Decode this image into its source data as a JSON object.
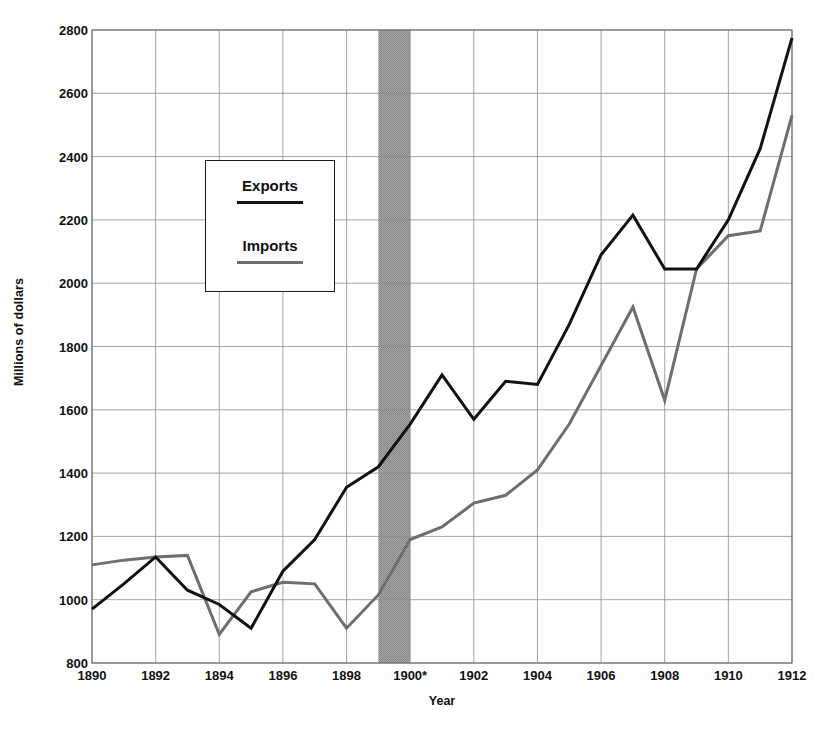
{
  "chart_data": {
    "type": "line",
    "title": "",
    "xlabel": "Year",
    "ylabel": "Millions of dollars",
    "xlim": [
      1890,
      1912
    ],
    "ylim": [
      800,
      2800
    ],
    "xticks": [
      "1890",
      "1892",
      "1894",
      "1896",
      "1898",
      "1900*",
      "1902",
      "1904",
      "1906",
      "1908",
      "1910",
      "1912"
    ],
    "xtick_values": [
      1890,
      1892,
      1894,
      1896,
      1898,
      1900,
      1902,
      1904,
      1906,
      1908,
      1910,
      1912
    ],
    "yticks": [
      "800",
      "1000",
      "1200",
      "1400",
      "1600",
      "1800",
      "2000",
      "2200",
      "2400",
      "2600",
      "2800"
    ],
    "ytick_values": [
      800,
      1000,
      1200,
      1400,
      1600,
      1800,
      2000,
      2200,
      2400,
      2600,
      2800
    ],
    "grid": true,
    "legend_position": "upper-left-inset",
    "x": [
      1890,
      1891,
      1892,
      1893,
      1894,
      1895,
      1896,
      1897,
      1898,
      1899,
      1900,
      1901,
      1902,
      1903,
      1904,
      1905,
      1906,
      1907,
      1908,
      1909,
      1910,
      1911,
      1912
    ],
    "series": [
      {
        "name": "Exports",
        "color": "#111111",
        "linewidth": 3,
        "values": [
          970,
          1050,
          1135,
          1030,
          985,
          910,
          1090,
          1190,
          1355,
          1420,
          1555,
          1710,
          1570,
          1690,
          1680,
          1870,
          2090,
          2215,
          2045,
          2045,
          2200,
          2425,
          2775
        ]
      },
      {
        "name": "Imports",
        "color": "#6e6e6e",
        "linewidth": 3,
        "values": [
          1110,
          1125,
          1135,
          1140,
          890,
          1025,
          1055,
          1050,
          910,
          1015,
          1190,
          1230,
          1305,
          1330,
          1410,
          1555,
          1740,
          1925,
          1630,
          2045,
          2150,
          2165,
          2530
        ]
      }
    ],
    "annotations": [
      {
        "type": "vspan",
        "name": "shaded-period-band",
        "x_start": 1899,
        "x_end": 1900,
        "color": "#9a9a9a"
      }
    ]
  },
  "axes": {
    "ylabel": "Millions of dollars",
    "xlabel": "Year"
  },
  "legend": {
    "entries": [
      {
        "label": "Exports",
        "color": "#111111"
      },
      {
        "label": "Imports",
        "color": "#6e6e6e"
      }
    ]
  }
}
